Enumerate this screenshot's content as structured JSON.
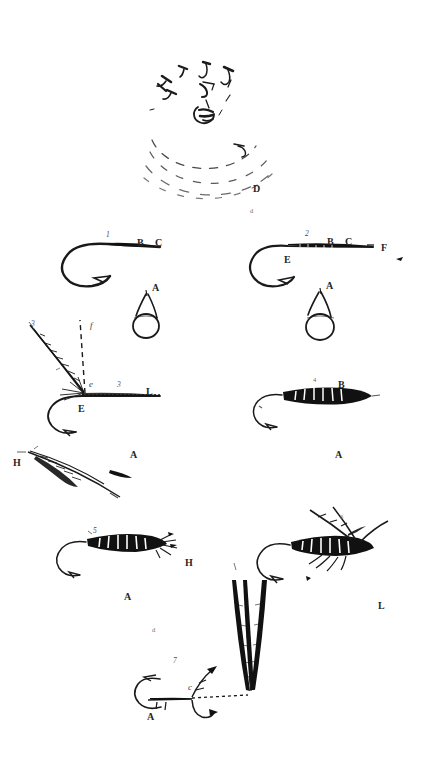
{
  "plate": {
    "title": "Fly-tying and hook construction plate",
    "background_color": "#ffffff",
    "ink_color": "#1a1a1a",
    "width": 424,
    "height": 760
  },
  "figures": [
    {
      "id": "fig-casting-diagram",
      "name": "casting-arc-diagram",
      "description": "Circular arrangement of small hook sketches above dashed concentric arcs",
      "labels": [
        "D"
      ]
    },
    {
      "id": "fig-1-bare-hook-left",
      "name": "bare-hook-figure-1",
      "description": "Bare hook, shank to the right, with eye loop below",
      "labels": [
        "1",
        "B",
        "C",
        "A"
      ]
    },
    {
      "id": "fig-2-bare-hook-right",
      "name": "bare-hook-figure-2",
      "description": "Bare hook with whipped shank, eye loop below",
      "labels": [
        "2",
        "B",
        "C",
        "E",
        "F",
        "A"
      ]
    },
    {
      "id": "fig-3-hackle-tie-in",
      "name": "hackle-tie-in-figure-3",
      "description": "Hook with hackle feather tied in at the head and silk strand",
      "labels": [
        "3",
        "f",
        "e",
        "E",
        "L"
      ]
    },
    {
      "id": "fig-dressed-body-right",
      "name": "dressed-body-fly",
      "description": "Hook with ribbed dark body dressed on the shank",
      "labels": [
        "B",
        "A"
      ]
    },
    {
      "id": "fig-hackle-feather",
      "name": "loose-hackle-feather",
      "description": "Single loose hackle feather lying at an angle",
      "labels": [
        "H",
        "A"
      ]
    },
    {
      "id": "fig-winged-fly-left",
      "name": "winged-fly-left",
      "description": "Completed fly with ribbed body and sparse hackle",
      "labels": [
        "A",
        "H"
      ]
    },
    {
      "id": "fig-winged-fly-right",
      "name": "winged-fly-right",
      "description": "Completed fly with ribbed body, wings and legs",
      "labels": [
        "L"
      ]
    },
    {
      "id": "fig-quill-slips",
      "name": "quill-wing-slips",
      "description": "Pair of long dark quill wing slips standing vertically",
      "labels": []
    },
    {
      "id": "fig-bottom-hook",
      "name": "bottom-hook-with-whip",
      "description": "Hook with whip finish and tying silk, bottom of plate",
      "labels": [
        "7",
        "c",
        "A"
      ]
    }
  ],
  "labels": [
    {
      "text": "D",
      "x": 253,
      "y": 184,
      "style": "cap"
    },
    {
      "text": "d",
      "x": 250,
      "y": 208,
      "style": "tiny"
    },
    {
      "text": "1",
      "x": 106,
      "y": 231,
      "style": "num"
    },
    {
      "text": "B",
      "x": 137,
      "y": 238,
      "style": "cap"
    },
    {
      "text": "C",
      "x": 155,
      "y": 238,
      "style": "cap"
    },
    {
      "text": "A",
      "x": 152,
      "y": 283,
      "style": "cap"
    },
    {
      "text": "2",
      "x": 305,
      "y": 230,
      "style": "num"
    },
    {
      "text": "B",
      "x": 327,
      "y": 237,
      "style": "cap"
    },
    {
      "text": "C",
      "x": 345,
      "y": 237,
      "style": "cap"
    },
    {
      "text": "F",
      "x": 381,
      "y": 243,
      "style": "cap"
    },
    {
      "text": "E",
      "x": 284,
      "y": 255,
      "style": "cap"
    },
    {
      "text": "A",
      "x": 326,
      "y": 281,
      "style": "cap"
    },
    {
      "text": "3",
      "x": 31,
      "y": 320,
      "style": "num"
    },
    {
      "text": "f",
      "x": 90,
      "y": 321,
      "style": "it"
    },
    {
      "text": "e",
      "x": 89,
      "y": 380,
      "style": "it"
    },
    {
      "text": "3",
      "x": 117,
      "y": 381,
      "style": "num"
    },
    {
      "text": "L",
      "x": 146,
      "y": 387,
      "style": "cap"
    },
    {
      "text": "E",
      "x": 78,
      "y": 404,
      "style": "cap"
    },
    {
      "text": "4",
      "x": 313,
      "y": 377,
      "style": "tiny"
    },
    {
      "text": "B",
      "x": 338,
      "y": 380,
      "style": "cap"
    },
    {
      "text": "A",
      "x": 130,
      "y": 450,
      "style": "cap"
    },
    {
      "text": "A",
      "x": 335,
      "y": 450,
      "style": "cap"
    },
    {
      "text": "H",
      "x": 13,
      "y": 458,
      "style": "cap"
    },
    {
      "text": "5",
      "x": 93,
      "y": 527,
      "style": "num"
    },
    {
      "text": "H",
      "x": 185,
      "y": 558,
      "style": "cap"
    },
    {
      "text": "A",
      "x": 124,
      "y": 592,
      "style": "cap"
    },
    {
      "text": "6",
      "x": 340,
      "y": 514,
      "style": "tiny"
    },
    {
      "text": "L",
      "x": 378,
      "y": 601,
      "style": "cap"
    },
    {
      "text": "d",
      "x": 152,
      "y": 627,
      "style": "tiny"
    },
    {
      "text": "7",
      "x": 173,
      "y": 657,
      "style": "num"
    },
    {
      "text": "c",
      "x": 188,
      "y": 683,
      "style": "it"
    },
    {
      "text": "A",
      "x": 147,
      "y": 712,
      "style": "cap"
    }
  ]
}
